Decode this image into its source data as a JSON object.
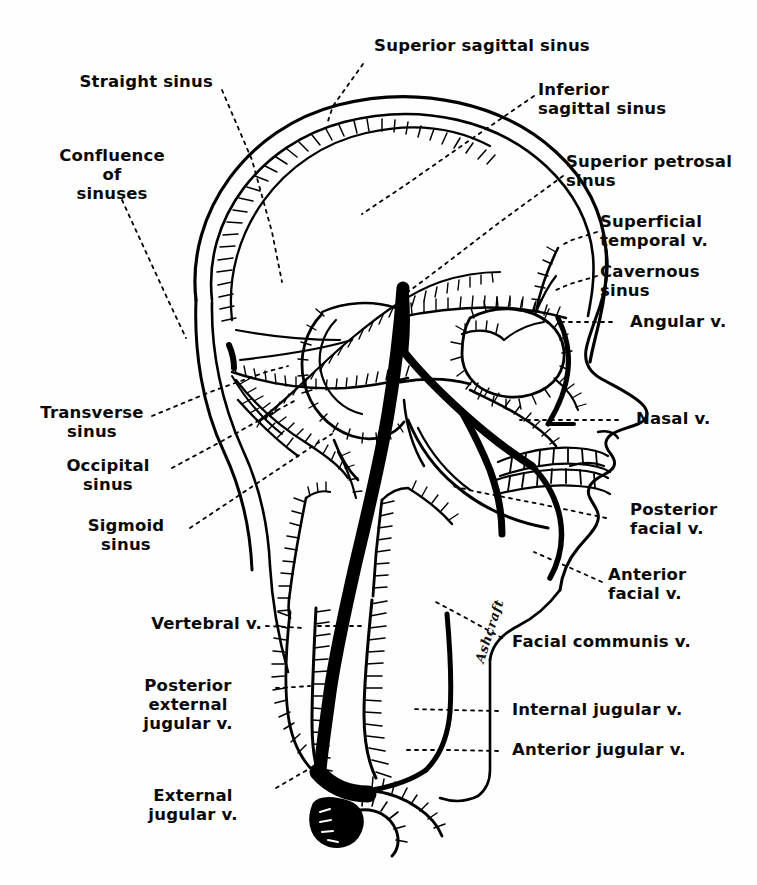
{
  "figure": {
    "style": "black-and-white pen-and-ink anatomical line drawing",
    "background_color": "#ffffff",
    "ink_color": "#000000",
    "signature": "Ashcraft"
  },
  "labels": {
    "superior_sagittal_sinus": "Superior sagittal sinus",
    "straight_sinus": "Straight sinus",
    "confluence_of_sinuses": "Confluence\nof\nsinuses",
    "inferior_sagittal_sinus": "Inferior\nsagittal sinus",
    "superior_petrosal_sinus": "Superior petrosal\nsinus",
    "superficial_temporal_v": "Superficial\ntemporal v.",
    "cavernous_sinus": "Cavernous\nsinus",
    "angular_v": "Angular v.",
    "nasal_v": "Nasal v.",
    "transverse_sinus": "Transverse\nsinus",
    "occipital_sinus": "Occipital\nsinus",
    "sigmoid_sinus": "Sigmoid\nsinus",
    "posterior_facial_v": "Posterior\nfacial v.",
    "anterior_facial_v": "Anterior\nfacial v.",
    "facial_communis_v": "Facial communis v.",
    "vertebral_v": "Vertebral v.",
    "posterior_external_jugular_v": "Posterior\nexternal\njugular v.",
    "internal_jugular_v": "Internal jugular v.",
    "anterior_jugular_v": "Anterior jugular v.",
    "external_jugular_v": "External\njugular v."
  },
  "label_lines": [
    {
      "name": "superior-sagittal-sinus",
      "from": [
        363,
        58
      ],
      "to": [
        330,
        110
      ]
    },
    {
      "name": "straight-sinus",
      "from": [
        215,
        85
      ],
      "to": [
        275,
        230
      ]
    },
    {
      "name": "confluence-of-sinuses",
      "from": [
        118,
        193
      ],
      "to": [
        163,
        300
      ]
    },
    {
      "name": "inferior-sagittal-sinus",
      "from": [
        536,
        92
      ],
      "to": [
        400,
        182
      ]
    },
    {
      "name": "superior-petrosal-sinus",
      "from": [
        566,
        172
      ],
      "to": [
        430,
        300
      ]
    },
    {
      "name": "superficial-temporal-v",
      "from": [
        600,
        228
      ],
      "to": [
        560,
        248
      ]
    },
    {
      "name": "cavernous-sinus",
      "from": [
        600,
        272
      ],
      "to": [
        558,
        290
      ]
    },
    {
      "name": "angular-v",
      "from": [
        615,
        322
      ],
      "to": [
        560,
        322
      ]
    },
    {
      "name": "nasal-v",
      "from": [
        622,
        420
      ],
      "to": [
        530,
        420
      ]
    },
    {
      "name": "transverse-sinus",
      "from": [
        150,
        418
      ],
      "to": [
        290,
        360
      ]
    },
    {
      "name": "occipital-sinus",
      "from": [
        170,
        470
      ],
      "to": [
        300,
        400
      ]
    },
    {
      "name": "sigmoid-sinus",
      "from": [
        185,
        530
      ],
      "to": [
        330,
        430
      ]
    },
    {
      "name": "posterior-facial-v",
      "from": [
        610,
        520
      ],
      "to": [
        460,
        480
      ]
    },
    {
      "name": "anterior-facial-v",
      "from": [
        605,
        585
      ],
      "to": [
        520,
        555
      ]
    },
    {
      "name": "facial-communis-v",
      "from": [
        505,
        640
      ],
      "to": [
        425,
        600
      ]
    },
    {
      "name": "vertebral-v",
      "from": [
        268,
        625
      ],
      "to": [
        310,
        628
      ]
    },
    {
      "name": "posterior-external-jugular-v",
      "from": [
        278,
        688
      ],
      "to": [
        316,
        686
      ]
    },
    {
      "name": "internal-jugular-v",
      "from": [
        500,
        712
      ],
      "to": [
        410,
        708
      ]
    },
    {
      "name": "anterior-jugular-v",
      "from": [
        500,
        752
      ],
      "to": [
        390,
        750
      ]
    },
    {
      "name": "external-jugular-v",
      "from": [
        278,
        790
      ],
      "to": [
        322,
        762
      ]
    }
  ],
  "colors": {
    "ink": "#000000",
    "paper": "#ffffff"
  }
}
